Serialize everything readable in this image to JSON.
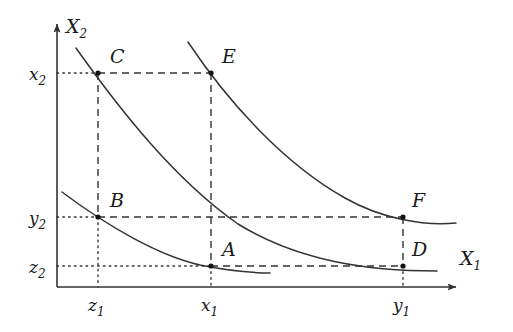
{
  "figure": {
    "title": "",
    "type": "diagram",
    "background_color": "#ffffff",
    "ink_color": "#333333"
  },
  "axes": {
    "x_axis": {
      "label_base": "X",
      "label_sub": "1",
      "label_full": "X₁",
      "origin_px": [
        57,
        287
      ],
      "end_px": [
        458,
        287
      ],
      "arrow": true
    },
    "y_axis": {
      "label_base": "X",
      "label_sub": "2",
      "label_full": "X₂",
      "origin_px": [
        57,
        287
      ],
      "end_px": [
        57,
        22
      ],
      "arrow": true
    }
  },
  "x_ticks": [
    {
      "name": "z1",
      "base": "z",
      "sub": "1",
      "px": 98
    },
    {
      "name": "x1",
      "base": "x",
      "sub": "1",
      "px": 211
    },
    {
      "name": "y1",
      "base": "y",
      "sub": "1",
      "px": 403
    }
  ],
  "y_ticks": [
    {
      "name": "x2",
      "base": "x",
      "sub": "2",
      "px": 73
    },
    {
      "name": "y2",
      "base": "y",
      "sub": "2",
      "px": 217
    },
    {
      "name": "z2",
      "base": "z",
      "sub": "2",
      "px": 266
    }
  ],
  "points": [
    {
      "label": "C",
      "x_tick": "z1",
      "y_tick": "x2",
      "px": [
        98,
        73
      ],
      "label_px": [
        110,
        63
      ]
    },
    {
      "label": "E",
      "x_tick": "x1",
      "y_tick": "x2",
      "px": [
        211,
        73
      ],
      "label_px": [
        222,
        63
      ]
    },
    {
      "label": "B",
      "x_tick": "z1",
      "y_tick": "y2",
      "px": [
        98,
        217
      ],
      "label_px": [
        110,
        207
      ]
    },
    {
      "label": "F",
      "x_tick": "y1",
      "y_tick": "y2",
      "px": [
        403,
        217
      ],
      "label_px": [
        412,
        207
      ]
    },
    {
      "label": "A",
      "x_tick": "x1",
      "y_tick": "z2",
      "px": [
        211,
        266
      ],
      "label_px": [
        222,
        256
      ]
    },
    {
      "label": "D",
      "x_tick": "y1",
      "y_tick": "z2",
      "px": [
        403,
        266
      ],
      "label_px": [
        412,
        256
      ]
    }
  ],
  "curves": [
    {
      "name": "lowest-indifference-curve",
      "through_points": [
        "B",
        "A"
      ],
      "path": "M 62,192 C 110,228 160,256 200,265 C 230,271 252,273 270,273"
    },
    {
      "name": "middle-indifference-curve",
      "through_points": [
        "C",
        "D"
      ],
      "path": "M 76,48 C 120,110 175,180 238,224 C 300,262 370,271 437,271"
    },
    {
      "name": "highest-indifference-curve",
      "through_points": [
        "E",
        "F"
      ],
      "path": "M 188,42 C 230,105 286,165 345,198 C 382,219 424,226 456,223"
    }
  ],
  "connectors": {
    "dashed": [
      {
        "name": "C-to-E-horizontal",
        "from": [
          98,
          73
        ],
        "to": [
          211,
          73
        ]
      },
      {
        "name": "B-to-F-horizontal",
        "from": [
          98,
          217
        ],
        "to": [
          403,
          217
        ]
      },
      {
        "name": "A-to-D-horizontal",
        "from": [
          211,
          266
        ],
        "to": [
          403,
          266
        ]
      },
      {
        "name": "C-to-B-vertical",
        "from": [
          98,
          73
        ],
        "to": [
          98,
          217
        ]
      },
      {
        "name": "E-to-A-vertical",
        "from": [
          211,
          73
        ],
        "to": [
          211,
          266
        ]
      },
      {
        "name": "F-to-D-vertical",
        "from": [
          403,
          217
        ],
        "to": [
          403,
          266
        ]
      }
    ],
    "dotted": [
      {
        "name": "x2-axis-guide",
        "from": [
          57,
          73
        ],
        "to": [
          98,
          73
        ]
      },
      {
        "name": "y2-axis-guide",
        "from": [
          57,
          217
        ],
        "to": [
          98,
          217
        ]
      },
      {
        "name": "z2-axis-guide",
        "from": [
          57,
          266
        ],
        "to": [
          211,
          266
        ]
      },
      {
        "name": "z1-tick-guide",
        "from": [
          98,
          217
        ],
        "to": [
          98,
          287
        ]
      },
      {
        "name": "x1-tick-guide",
        "from": [
          211,
          266
        ],
        "to": [
          211,
          287
        ]
      },
      {
        "name": "y1-tick-guide",
        "from": [
          403,
          266
        ],
        "to": [
          403,
          287
        ]
      }
    ]
  }
}
